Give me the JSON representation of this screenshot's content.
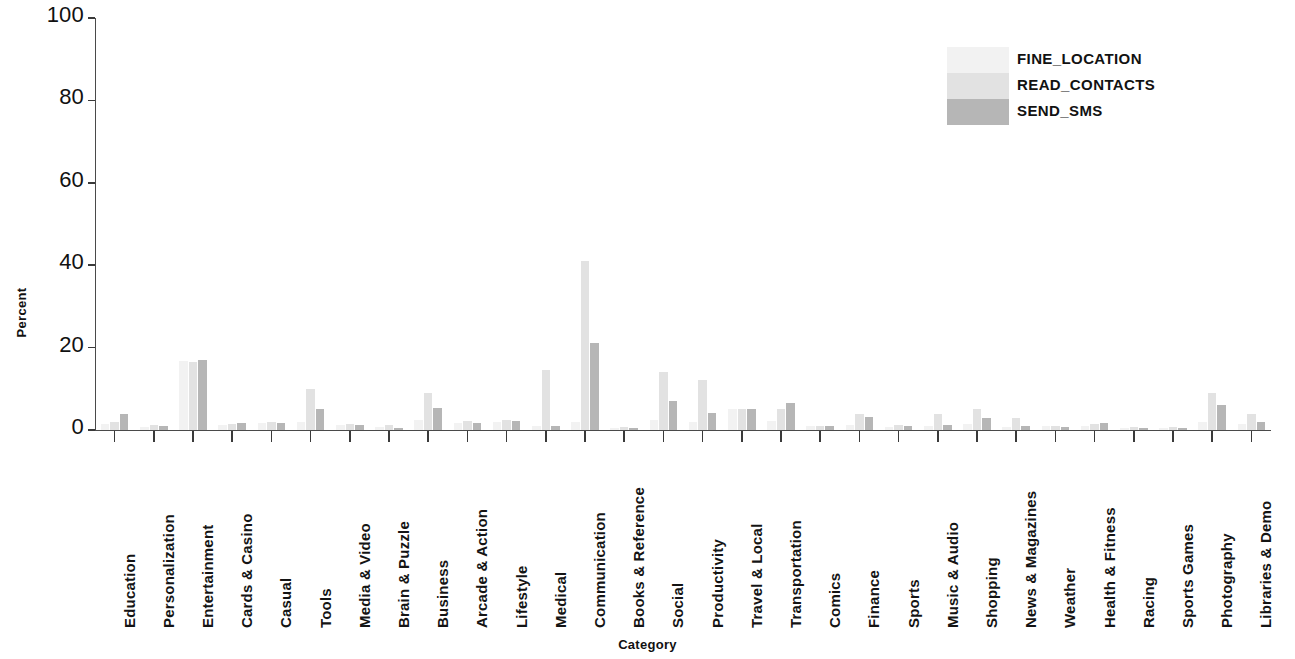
{
  "chart_data": {
    "type": "bar",
    "title": "",
    "subtitle": "",
    "xlabel": "Category",
    "ylabel": "Percent",
    "ylim": [
      0,
      100
    ],
    "yticks": [
      0,
      20,
      40,
      60,
      80,
      100
    ],
    "grid": false,
    "legend_position": "top-right",
    "categories": [
      "Education",
      "Personalization",
      "Entertainment",
      "Cards & Casino",
      "Casual",
      "Tools",
      "Media & Video",
      "Brain & Puzzle",
      "Business",
      "Arcade & Action",
      "Lifestyle",
      "Medical",
      "Communication",
      "Books & Reference",
      "Social",
      "Productivity",
      "Travel & Local",
      "Transportation",
      "Comics",
      "Finance",
      "Sports",
      "Music & Audio",
      "Shopping",
      "News & Magazines",
      "Weather",
      "Health & Fitness",
      "Racing",
      "Sports Games",
      "Photography",
      "Libraries & Demo"
    ],
    "series": [
      {
        "name": "FINE_LOCATION",
        "color": "#f2f2f2",
        "values": [
          1.5,
          0.8,
          16.8,
          1.2,
          1.6,
          2.0,
          1.2,
          0.8,
          2.5,
          1.6,
          2.0,
          1.0,
          2.0,
          0.6,
          2.5,
          2.0,
          5.0,
          2.2,
          0.9,
          1.2,
          0.7,
          1.0,
          1.5,
          0.8,
          1.0,
          1.0,
          0.5,
          0.5,
          2.0,
          1.5
        ]
      },
      {
        "name": "READ_CONTACTS",
        "color": "#e2e2e2",
        "values": [
          2.0,
          1.2,
          16.6,
          1.5,
          2.0,
          10.0,
          1.5,
          1.2,
          9.0,
          2.2,
          2.5,
          14.5,
          41.0,
          0.8,
          14.0,
          12.2,
          5.0,
          5.0,
          1.0,
          4.0,
          1.2,
          4.0,
          5.0,
          3.0,
          1.0,
          1.5,
          0.7,
          0.8,
          9.0,
          4.0
        ]
      },
      {
        "name": "SEND_SMS",
        "color": "#b6b6b6",
        "values": [
          3.8,
          1.0,
          16.9,
          1.6,
          1.8,
          5.0,
          1.3,
          0.6,
          5.4,
          1.7,
          2.3,
          1.0,
          21.2,
          0.5,
          7.0,
          4.2,
          5.0,
          6.5,
          1.0,
          3.2,
          1.0,
          1.2,
          3.0,
          1.0,
          0.7,
          1.8,
          0.4,
          0.4,
          6.0,
          2.0
        ]
      }
    ]
  },
  "legend": {
    "items": [
      {
        "label": "FINE_LOCATION"
      },
      {
        "label": "READ_CONTACTS"
      },
      {
        "label": "SEND_SMS"
      }
    ]
  },
  "axes": {
    "y_title": "Percent",
    "x_title": "Category",
    "y_tick_labels": [
      "100",
      "80",
      "60",
      "40",
      "20",
      "0"
    ]
  }
}
